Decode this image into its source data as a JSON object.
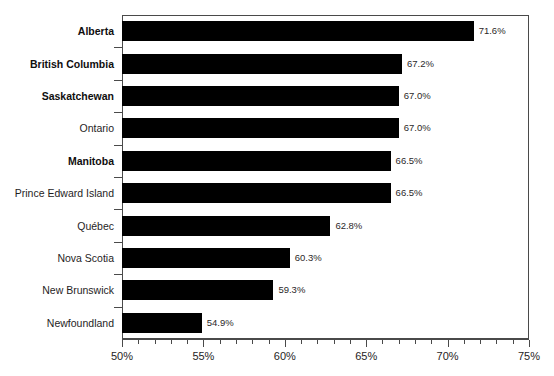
{
  "chart_data": {
    "type": "bar",
    "orientation": "horizontal",
    "title": "",
    "subtitle": "",
    "xlabel": "",
    "ylabel": "",
    "xlim": [
      50,
      75
    ],
    "grid": false,
    "legend": null,
    "bar_color": "#000000",
    "axis_color": "#4a4a4a",
    "background": "#ffffff",
    "xticks": [
      {
        "value": 50,
        "label": "50%"
      },
      {
        "value": 55,
        "label": "55%"
      },
      {
        "value": 60,
        "label": "60%"
      },
      {
        "value": 65,
        "label": "65%"
      },
      {
        "value": 70,
        "label": "70%"
      },
      {
        "value": 75,
        "label": "75%"
      }
    ],
    "minor_tick_step": 1,
    "categories": [
      "Alberta",
      "British Columbia",
      "Saskatchewan",
      "Ontario",
      "Manitoba",
      "Prince Edward Island",
      "Québec",
      "Nova Scotia",
      "New Brunswick",
      "Newfoundland"
    ],
    "values": [
      71.6,
      67.2,
      67.0,
      67.0,
      66.5,
      66.5,
      62.8,
      60.3,
      59.3,
      54.9
    ],
    "value_labels": [
      "71.6%",
      "67.2%",
      "67.0%",
      "67.0%",
      "66.5%",
      "66.5%",
      "62.8%",
      "60.3%",
      "59.3%",
      "54.9%"
    ],
    "emphasized_categories": [
      "Alberta",
      "British Columbia",
      "Saskatchewan",
      "Manitoba"
    ]
  }
}
